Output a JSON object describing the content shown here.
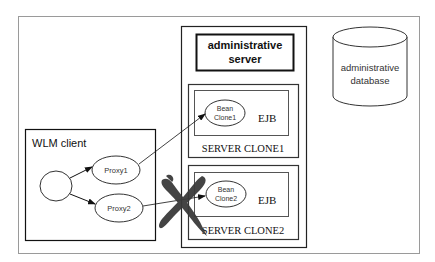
{
  "diagram": {
    "colors": {
      "frame": "#9a9a9a",
      "line": "#1a1a1a",
      "cross": "#3a3a3a",
      "background": "#ffffff"
    },
    "admin_server": {
      "line1": "administrative",
      "line2": "server"
    },
    "admin_database": {
      "line1": "administrative",
      "line2": "database"
    },
    "clone1": {
      "server_label": "SERVER CLONE1",
      "ejb_label": "EJB",
      "bean_line1": "Bean",
      "bean_line2": "Clone1"
    },
    "clone2": {
      "server_label": "SERVER CLONE2",
      "ejb_label": "EJB",
      "bean_line1": "Bean",
      "bean_line2": "Clone2",
      "status": "failed"
    },
    "wlm_client": {
      "label": "WLM client",
      "proxies": [
        {
          "label": "Proxy1"
        },
        {
          "label": "Proxy2"
        }
      ]
    },
    "connections": [
      {
        "from": "client",
        "to": "Proxy1"
      },
      {
        "from": "client",
        "to": "Proxy2"
      },
      {
        "from": "Proxy1",
        "to": "Bean Clone1"
      },
      {
        "from": "Proxy2",
        "to": "Bean Clone2",
        "broken": true
      }
    ]
  }
}
